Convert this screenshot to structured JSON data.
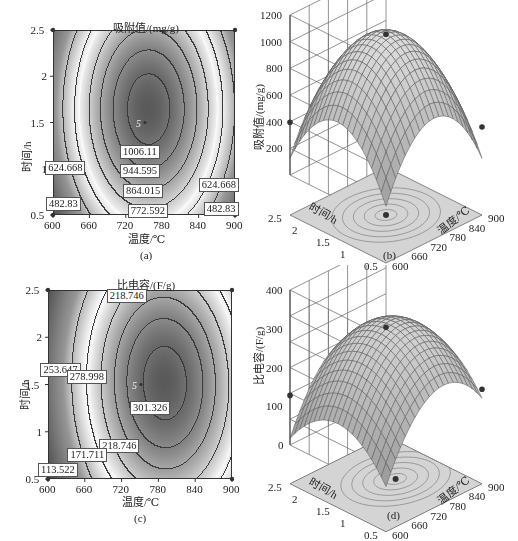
{
  "chart_data": [
    {
      "id": "a",
      "type": "contour",
      "title": "吸附值/(mg/g)",
      "xlabel": "温度/℃",
      "ylabel": "时间/h",
      "caption": "(a)",
      "x_ticks": [
        "600",
        "660",
        "720",
        "780",
        "840",
        "900"
      ],
      "y_ticks": [
        "0.5",
        "1",
        "1.5",
        "2",
        "2.5"
      ],
      "xlim": [
        600,
        900
      ],
      "ylim": [
        0.5,
        2.5
      ],
      "center_marker": {
        "label": "5",
        "x": 745,
        "y": 1.5
      },
      "contour_levels": [
        482.83,
        624.668,
        772.592,
        864.015,
        944.595,
        1006.11
      ],
      "contour_labels": [
        {
          "text": "1006.11",
          "x": 745,
          "y": 1.18
        },
        {
          "text": "944.595",
          "x": 745,
          "y": 0.98
        },
        {
          "text": "864.015",
          "x": 750,
          "y": 0.76
        },
        {
          "text": "772.592",
          "x": 758,
          "y": 0.54
        },
        {
          "text": "624.668",
          "x": 622,
          "y": 1.01
        },
        {
          "text": "624.668",
          "x": 875,
          "y": 0.82
        },
        {
          "text": "482.83",
          "x": 618,
          "y": 0.62
        },
        {
          "text": "482.83",
          "x": 878,
          "y": 0.57
        }
      ],
      "model": {
        "peak": 1040,
        "cx": 757,
        "cy": 1.65,
        "ax": 2.75e-05,
        "ay": 230
      }
    },
    {
      "id": "b",
      "type": "surface3d",
      "zlabel": "吸附值/(mg/g)",
      "xlabel": "温度/℃",
      "ylabel": "时间/h",
      "caption": "(b)",
      "z_ticks": [
        "200",
        "400",
        "600",
        "800",
        "1000",
        "1200"
      ],
      "x_ticks": [
        "600",
        "660",
        "720",
        "780",
        "840",
        "900"
      ],
      "y_ticks": [
        "0.5",
        "1",
        "1.5",
        "2",
        "2.5"
      ],
      "zlim": [
        0,
        1200
      ],
      "xlim": [
        600,
        900
      ],
      "ylim": [
        0.5,
        2.5
      ],
      "points": [
        {
          "x": 745,
          "y": 1.5,
          "z": 1050,
          "desc": "peak marker"
        },
        {
          "x": 600,
          "y": 2.5,
          "z": 400
        },
        {
          "x": 900,
          "y": 0.5,
          "z": 360
        }
      ]
    },
    {
      "id": "c",
      "type": "contour",
      "title": "比电容/(F/g)",
      "xlabel": "温度/℃",
      "ylabel": "时间/h",
      "caption": "(c)",
      "x_ticks": [
        "600",
        "660",
        "720",
        "780",
        "840",
        "900"
      ],
      "y_ticks": [
        "0.5",
        "1",
        "1.5",
        "2",
        "2.5"
      ],
      "xlim": [
        600,
        900
      ],
      "ylim": [
        0.5,
        2.5
      ],
      "center_marker": {
        "label": "5",
        "x": 745,
        "y": 1.5
      },
      "contour_levels": [
        113.522,
        171.711,
        218.746,
        253.647,
        278.998,
        301.326
      ],
      "contour_labels": [
        {
          "text": "218.746",
          "x": 730,
          "y": 2.44
        },
        {
          "text": "253.647",
          "x": 622,
          "y": 1.65
        },
        {
          "text": "278.998",
          "x": 665,
          "y": 1.58
        },
        {
          "text": "301.326",
          "x": 768,
          "y": 1.25
        },
        {
          "text": "218.746",
          "x": 718,
          "y": 0.85
        },
        {
          "text": "171.711",
          "x": 666,
          "y": 0.75
        },
        {
          "text": "113.522",
          "x": 618,
          "y": 0.59
        }
      ],
      "model": {
        "peak": 312,
        "cx": 790,
        "cy": 1.52,
        "ax": 8.5e-06,
        "ay": 70,
        "axy": 0.04
      }
    },
    {
      "id": "d",
      "type": "surface3d",
      "zlabel": "比电容/(F/g)",
      "xlabel": "温度/℃",
      "ylabel": "时间/h",
      "caption": "(d)",
      "z_ticks": [
        "0",
        "100",
        "200",
        "300",
        "400"
      ],
      "x_ticks": [
        "600",
        "660",
        "720",
        "780",
        "840",
        "900"
      ],
      "y_ticks": [
        "0.5",
        "1",
        "1.5",
        "2",
        "2.5"
      ],
      "zlim": [
        0,
        400
      ],
      "xlim": [
        600,
        900
      ],
      "ylim": [
        0.5,
        2.5
      ],
      "points": [
        {
          "x": 745,
          "y": 1.5,
          "z": 305,
          "desc": "peak marker"
        },
        {
          "x": 600,
          "y": 2.5,
          "z": 130
        },
        {
          "x": 900,
          "y": 0.5,
          "z": 145
        }
      ]
    }
  ],
  "panels": {
    "a": {
      "title": "吸附值/(mg/g)",
      "xlabel": "温度/℃",
      "ylabel": "时间/h",
      "caption": "(a)"
    },
    "b": {
      "zlabel": "吸附值/(mg/g)",
      "xlabel": "温度/℃",
      "ylabel": "时间/h",
      "caption": "(b)"
    },
    "c": {
      "title": "比电容/(F/g)",
      "xlabel": "温度/℃",
      "ylabel": "时间/h",
      "caption": "(c)"
    },
    "d": {
      "zlabel": "比电容/(F/g)",
      "xlabel": "温度/℃",
      "ylabel": "时间/h",
      "caption": "(d)"
    }
  }
}
